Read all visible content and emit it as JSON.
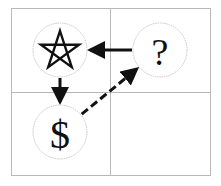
{
  "diagram": {
    "grid": {
      "rows": 2,
      "cols": 2
    },
    "nodes": [
      {
        "id": "star",
        "label": "",
        "icon": "star-outline-icon",
        "cell": [
          0,
          0
        ]
      },
      {
        "id": "question",
        "label": "?",
        "icon": "question-mark-icon",
        "cell": [
          0,
          1
        ]
      },
      {
        "id": "dollar",
        "label": "$",
        "icon": "dollar-sign-icon",
        "cell": [
          1,
          0
        ]
      }
    ],
    "edges": [
      {
        "from": "question",
        "to": "star",
        "style": "solid",
        "direction": "forward"
      },
      {
        "from": "star",
        "to": "dollar",
        "style": "solid",
        "direction": "forward"
      },
      {
        "from": "dollar",
        "to": "question",
        "style": "dashed",
        "direction": "forward"
      }
    ],
    "colors": {
      "grid": "#b8b8b8",
      "edge": "#111111",
      "node_border": "#c9c9c9",
      "background": "#ffffff"
    }
  }
}
